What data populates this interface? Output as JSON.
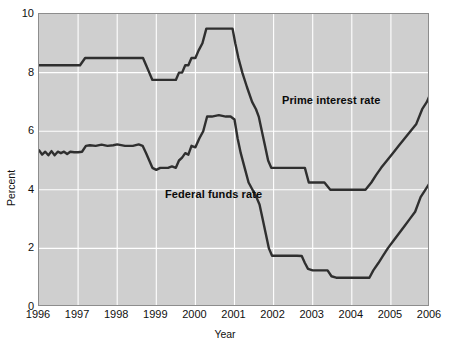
{
  "chart_data": {
    "type": "line",
    "title": "",
    "subtitle": "",
    "xlabel": "Year",
    "ylabel": "Percent",
    "xlim": [
      1996,
      2006
    ],
    "ylim": [
      0,
      10
    ],
    "grid": true,
    "legend_position": "inline-annotation",
    "x_ticks": [
      "1996",
      "1997",
      "1998",
      "1999",
      "2000",
      "2001",
      "2002",
      "2003",
      "2004",
      "2005",
      "2006"
    ],
    "y_ticks": [
      "0",
      "2",
      "4",
      "6",
      "8",
      "10"
    ],
    "background_color": "#cfcfcf",
    "gridline_color": "#ffffff",
    "line_color": "#2f2f2f",
    "series": [
      {
        "name": "Prime interest rate",
        "color": "#2f2f2f",
        "points": [
          [
            1996.0,
            8.25
          ],
          [
            1996.2,
            8.25
          ],
          [
            1996.4,
            8.25
          ],
          [
            1996.6,
            8.25
          ],
          [
            1996.8,
            8.25
          ],
          [
            1996.95,
            8.25
          ],
          [
            1997.05,
            8.25
          ],
          [
            1997.18,
            8.5
          ],
          [
            1997.3,
            8.5
          ],
          [
            1997.6,
            8.5
          ],
          [
            1998.0,
            8.5
          ],
          [
            1998.4,
            8.5
          ],
          [
            1998.66,
            8.5
          ],
          [
            1998.74,
            8.25
          ],
          [
            1998.82,
            8.0
          ],
          [
            1998.9,
            7.75
          ],
          [
            1999.0,
            7.75
          ],
          [
            1999.3,
            7.75
          ],
          [
            1999.5,
            7.75
          ],
          [
            1999.58,
            8.0
          ],
          [
            1999.66,
            8.0
          ],
          [
            1999.74,
            8.25
          ],
          [
            1999.82,
            8.25
          ],
          [
            1999.9,
            8.5
          ],
          [
            2000.0,
            8.5
          ],
          [
            2000.08,
            8.75
          ],
          [
            2000.18,
            9.0
          ],
          [
            2000.28,
            9.5
          ],
          [
            2000.4,
            9.5
          ],
          [
            2000.6,
            9.5
          ],
          [
            2000.8,
            9.5
          ],
          [
            2000.95,
            9.5
          ],
          [
            2001.02,
            9.0
          ],
          [
            2001.1,
            8.5
          ],
          [
            2001.2,
            8.0
          ],
          [
            2001.32,
            7.5
          ],
          [
            2001.45,
            7.0
          ],
          [
            2001.55,
            6.75
          ],
          [
            2001.62,
            6.5
          ],
          [
            2001.7,
            6.0
          ],
          [
            2001.78,
            5.5
          ],
          [
            2001.86,
            5.0
          ],
          [
            2001.94,
            4.75
          ],
          [
            2002.05,
            4.75
          ],
          [
            2002.4,
            4.75
          ],
          [
            2002.8,
            4.75
          ],
          [
            2002.9,
            4.25
          ],
          [
            2003.0,
            4.25
          ],
          [
            2003.3,
            4.25
          ],
          [
            2003.45,
            4.0
          ],
          [
            2003.6,
            4.0
          ],
          [
            2004.0,
            4.0
          ],
          [
            2004.35,
            4.0
          ],
          [
            2004.5,
            4.25
          ],
          [
            2004.62,
            4.5
          ],
          [
            2004.75,
            4.75
          ],
          [
            2004.9,
            5.0
          ],
          [
            2005.05,
            5.25
          ],
          [
            2005.2,
            5.5
          ],
          [
            2005.35,
            5.75
          ],
          [
            2005.5,
            6.0
          ],
          [
            2005.65,
            6.25
          ],
          [
            2005.8,
            6.75
          ],
          [
            2005.92,
            7.0
          ],
          [
            2006.0,
            7.25
          ]
        ]
      },
      {
        "name": "Federal funds rate",
        "color": "#2f2f2f",
        "points": [
          [
            1996.0,
            5.35
          ],
          [
            1996.08,
            5.2
          ],
          [
            1996.16,
            5.3
          ],
          [
            1996.24,
            5.18
          ],
          [
            1996.32,
            5.32
          ],
          [
            1996.4,
            5.18
          ],
          [
            1996.48,
            5.3
          ],
          [
            1996.56,
            5.25
          ],
          [
            1996.64,
            5.3
          ],
          [
            1996.72,
            5.22
          ],
          [
            1996.8,
            5.3
          ],
          [
            1996.9,
            5.28
          ],
          [
            1997.0,
            5.28
          ],
          [
            1997.1,
            5.3
          ],
          [
            1997.2,
            5.5
          ],
          [
            1997.3,
            5.52
          ],
          [
            1997.45,
            5.5
          ],
          [
            1997.6,
            5.54
          ],
          [
            1997.75,
            5.5
          ],
          [
            1997.9,
            5.52
          ],
          [
            1998.0,
            5.55
          ],
          [
            1998.2,
            5.5
          ],
          [
            1998.4,
            5.5
          ],
          [
            1998.55,
            5.55
          ],
          [
            1998.65,
            5.5
          ],
          [
            1998.74,
            5.25
          ],
          [
            1998.82,
            5.0
          ],
          [
            1998.9,
            4.75
          ],
          [
            1999.0,
            4.68
          ],
          [
            1999.1,
            4.75
          ],
          [
            1999.2,
            4.75
          ],
          [
            1999.3,
            4.75
          ],
          [
            1999.4,
            4.8
          ],
          [
            1999.5,
            4.75
          ],
          [
            1999.58,
            5.0
          ],
          [
            1999.66,
            5.1
          ],
          [
            1999.74,
            5.25
          ],
          [
            1999.82,
            5.2
          ],
          [
            1999.9,
            5.5
          ],
          [
            2000.0,
            5.45
          ],
          [
            2000.1,
            5.75
          ],
          [
            2000.2,
            6.0
          ],
          [
            2000.3,
            6.5
          ],
          [
            2000.42,
            6.5
          ],
          [
            2000.6,
            6.55
          ],
          [
            2000.78,
            6.5
          ],
          [
            2000.9,
            6.5
          ],
          [
            2001.0,
            6.4
          ],
          [
            2001.08,
            5.75
          ],
          [
            2001.16,
            5.25
          ],
          [
            2001.26,
            4.75
          ],
          [
            2001.36,
            4.25
          ],
          [
            2001.46,
            4.0
          ],
          [
            2001.56,
            3.75
          ],
          [
            2001.64,
            3.5
          ],
          [
            2001.72,
            3.0
          ],
          [
            2001.8,
            2.5
          ],
          [
            2001.88,
            2.0
          ],
          [
            2001.96,
            1.75
          ],
          [
            2002.1,
            1.75
          ],
          [
            2002.4,
            1.75
          ],
          [
            2002.6,
            1.75
          ],
          [
            2002.72,
            1.74
          ],
          [
            2002.8,
            1.5
          ],
          [
            2002.88,
            1.3
          ],
          [
            2003.0,
            1.25
          ],
          [
            2003.2,
            1.25
          ],
          [
            2003.38,
            1.25
          ],
          [
            2003.48,
            1.05
          ],
          [
            2003.6,
            1.0
          ],
          [
            2004.0,
            1.0
          ],
          [
            2004.3,
            1.0
          ],
          [
            2004.45,
            1.0
          ],
          [
            2004.55,
            1.25
          ],
          [
            2004.68,
            1.5
          ],
          [
            2004.8,
            1.75
          ],
          [
            2004.92,
            2.0
          ],
          [
            2005.06,
            2.25
          ],
          [
            2005.2,
            2.5
          ],
          [
            2005.34,
            2.75
          ],
          [
            2005.48,
            3.0
          ],
          [
            2005.62,
            3.25
          ],
          [
            2005.76,
            3.75
          ],
          [
            2005.88,
            4.0
          ],
          [
            2006.0,
            4.25
          ]
        ]
      }
    ],
    "annotations": [
      {
        "text": "Prime interest rate",
        "x": 2001.3,
        "y": 8.2
      },
      {
        "text": "Federal funds rate",
        "x": 1998.1,
        "y": 4.95
      }
    ]
  }
}
